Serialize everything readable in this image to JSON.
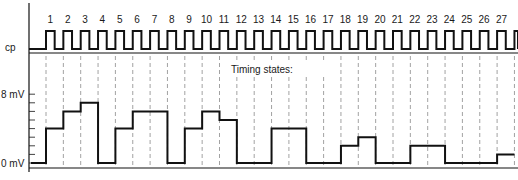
{
  "diagram": {
    "title": "Timing states:",
    "clock_label": "cp",
    "y_axis": {
      "labels": [
        {
          "text": "8 mV",
          "value": 8
        },
        {
          "text": "0 mV",
          "value": 0
        }
      ],
      "min": 0,
      "max": 8,
      "tick_step": 1
    },
    "states": [
      "1",
      "2",
      "3",
      "4",
      "5",
      "6",
      "7",
      "8",
      "9",
      "10",
      "11",
      "12",
      "13",
      "14",
      "15",
      "16",
      "17",
      "18",
      "19",
      "20",
      "21",
      "22",
      "23",
      "24",
      "25",
      "26",
      "27"
    ],
    "waveform_mV": [
      4,
      6,
      7,
      0,
      4,
      6,
      6,
      0,
      4,
      6,
      5,
      0,
      0,
      4,
      4,
      0,
      0,
      2,
      3,
      0,
      0,
      2,
      2,
      0,
      0,
      0,
      1
    ],
    "initial_level_mV": 0,
    "colors": {
      "line": "#111111",
      "grid_dash": "#8a8a8a",
      "background": "#ffffff"
    }
  }
}
